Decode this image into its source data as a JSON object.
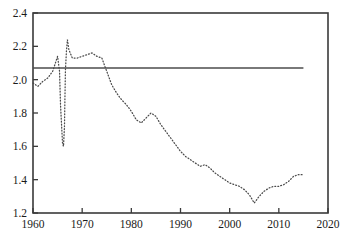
{
  "chart_data": {
    "type": "line",
    "title": "",
    "subtitle": "",
    "xlabel": "",
    "ylabel": "",
    "xlim": [
      1960,
      2020
    ],
    "ylim": [
      1.2,
      2.4
    ],
    "xticks": [
      1960,
      1970,
      1980,
      1990,
      2000,
      2010,
      2020
    ],
    "yticks": [
      1.2,
      1.4,
      1.6,
      1.8,
      2.0,
      2.2,
      2.4
    ],
    "xtick_labels": [
      "1960",
      "1970",
      "1980",
      "1990",
      "2000",
      "2010",
      "2020"
    ],
    "ytick_labels": [
      "1.2",
      "1.4",
      "1.6",
      "1.8",
      "2.0",
      "2.2",
      "2.4"
    ],
    "grid": false,
    "legend": null,
    "legend_position": "none",
    "annotations": [],
    "series": [
      {
        "name": "observed",
        "style": "dotted",
        "color": "#4a4a4a",
        "x": [
          1960,
          1961,
          1962,
          1963,
          1964,
          1965,
          1965.4,
          1965.6,
          1966,
          1966.2,
          1966.4,
          1966.5,
          1966.6,
          1966.8,
          1967,
          1967.3,
          1968,
          1969,
          1970,
          1971,
          1972,
          1973,
          1974,
          1975,
          1976,
          1977,
          1978,
          1979,
          1980,
          1981,
          1982,
          1983,
          1984,
          1985,
          1986,
          1987,
          1988,
          1989,
          1990,
          1991,
          1992,
          1993,
          1994,
          1995,
          1996,
          1997,
          1998,
          1999,
          2000,
          2001,
          2002,
          2003,
          2004,
          2005,
          2006,
          2007,
          2008,
          2009,
          2010,
          2011,
          2012,
          2013,
          2014,
          2015
        ],
        "y": [
          1.98,
          1.96,
          1.99,
          2.01,
          2.05,
          2.14,
          2.05,
          1.85,
          1.62,
          1.6,
          1.72,
          1.9,
          2.06,
          2.17,
          2.24,
          2.18,
          2.13,
          2.13,
          2.14,
          2.15,
          2.16,
          2.14,
          2.13,
          2.05,
          1.97,
          1.92,
          1.88,
          1.85,
          1.81,
          1.76,
          1.74,
          1.77,
          1.8,
          1.78,
          1.73,
          1.69,
          1.65,
          1.61,
          1.57,
          1.54,
          1.52,
          1.5,
          1.48,
          1.49,
          1.47,
          1.44,
          1.42,
          1.4,
          1.38,
          1.37,
          1.36,
          1.34,
          1.31,
          1.26,
          1.3,
          1.33,
          1.35,
          1.36,
          1.36,
          1.37,
          1.39,
          1.42,
          1.43,
          1.43
        ]
      },
      {
        "name": "replacement-level-reference",
        "style": "solid",
        "color": "#4d4d4d",
        "x": [
          1960,
          2015
        ],
        "y": [
          2.07,
          2.07
        ]
      }
    ]
  }
}
